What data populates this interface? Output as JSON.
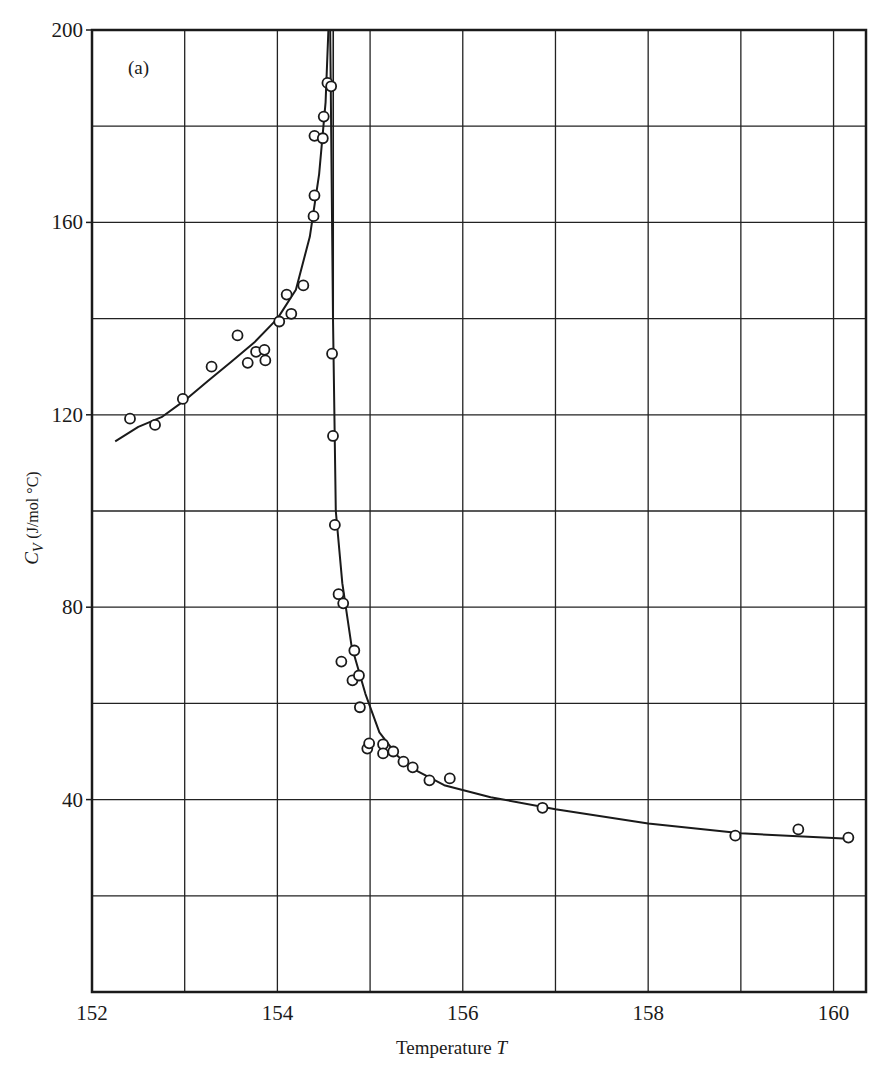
{
  "chart_data": {
    "type": "scatter",
    "title": "",
    "panel_label": "(a)",
    "xlabel": "Temperature",
    "xlabel_var": "T",
    "ylabel_var": "C",
    "ylabel_sub": "V",
    "ylabel_units": "(J/mol °C)",
    "xlim": [
      152,
      160.35
    ],
    "ylim": [
      0,
      200
    ],
    "x_ticks": [
      152,
      154,
      156,
      158,
      160
    ],
    "x_tick_labels": [
      "152",
      "154",
      "156",
      "158",
      "160"
    ],
    "x_grid": [
      152,
      153,
      154,
      155,
      156,
      157,
      158,
      159,
      160
    ],
    "y_ticks": [
      40,
      80,
      120,
      160,
      200
    ],
    "y_tick_labels": [
      "40",
      "80",
      "120",
      "160",
      "200"
    ],
    "y_grid": [
      20,
      40,
      60,
      80,
      100,
      120,
      140,
      160,
      180,
      200
    ],
    "grid": true,
    "legend": null,
    "critical_temperature": 154.57,
    "series": [
      {
        "name": "measured Cv (open circles)",
        "marker": "open-circle",
        "points": [
          [
            152.41,
            119.2
          ],
          [
            152.68,
            117.9
          ],
          [
            152.98,
            123.3
          ],
          [
            153.29,
            130.0
          ],
          [
            153.57,
            136.5
          ],
          [
            153.68,
            130.8
          ],
          [
            153.77,
            133.1
          ],
          [
            153.86,
            133.5
          ],
          [
            153.87,
            131.3
          ],
          [
            154.02,
            139.4
          ],
          [
            154.1,
            145.0
          ],
          [
            154.15,
            141.0
          ],
          [
            154.28,
            146.9
          ],
          [
            154.39,
            161.3
          ],
          [
            154.4,
            165.6
          ],
          [
            154.4,
            178.0
          ],
          [
            154.49,
            177.5
          ],
          [
            154.5,
            182.0
          ],
          [
            154.54,
            189.0
          ],
          [
            154.58,
            188.3
          ],
          [
            154.59,
            132.7
          ],
          [
            154.6,
            115.6
          ],
          [
            154.62,
            97.1
          ],
          [
            154.66,
            82.7
          ],
          [
            154.71,
            80.8
          ],
          [
            154.69,
            68.7
          ],
          [
            154.83,
            71.0
          ],
          [
            154.81,
            64.8
          ],
          [
            154.88,
            65.8
          ],
          [
            154.89,
            59.2
          ],
          [
            154.97,
            50.6
          ],
          [
            154.99,
            51.7
          ],
          [
            155.14,
            51.5
          ],
          [
            155.14,
            49.6
          ],
          [
            155.25,
            50.0
          ],
          [
            155.36,
            47.9
          ],
          [
            155.46,
            46.7
          ],
          [
            155.64,
            44.0
          ],
          [
            155.86,
            44.4
          ],
          [
            156.86,
            38.3
          ],
          [
            158.94,
            32.5
          ],
          [
            159.62,
            33.8
          ],
          [
            160.16,
            32.1
          ]
        ]
      },
      {
        "name": "fitted curve below Tc",
        "marker": "line",
        "points": [
          [
            152.25,
            114.5
          ],
          [
            152.5,
            117.5
          ],
          [
            152.75,
            119.5
          ],
          [
            153.0,
            123.0
          ],
          [
            153.25,
            127.0
          ],
          [
            153.5,
            131.0
          ],
          [
            153.75,
            135.0
          ],
          [
            154.0,
            140.0
          ],
          [
            154.2,
            146.0
          ],
          [
            154.35,
            157.0
          ],
          [
            154.45,
            170.0
          ],
          [
            154.52,
            185.0
          ],
          [
            154.55,
            200.0
          ]
        ]
      },
      {
        "name": "fitted curve above Tc",
        "marker": "line",
        "points": [
          [
            154.57,
            200.0
          ],
          [
            154.6,
            140.0
          ],
          [
            154.63,
            100.0
          ],
          [
            154.7,
            85.0
          ],
          [
            154.8,
            72.0
          ],
          [
            154.95,
            62.0
          ],
          [
            155.1,
            54.0
          ],
          [
            155.3,
            49.0
          ],
          [
            155.5,
            46.0
          ],
          [
            155.8,
            43.0
          ],
          [
            156.3,
            40.5
          ],
          [
            157.0,
            38.0
          ],
          [
            158.0,
            35.0
          ],
          [
            159.0,
            33.0
          ],
          [
            160.0,
            32.0
          ],
          [
            160.2,
            31.8
          ]
        ]
      }
    ]
  }
}
